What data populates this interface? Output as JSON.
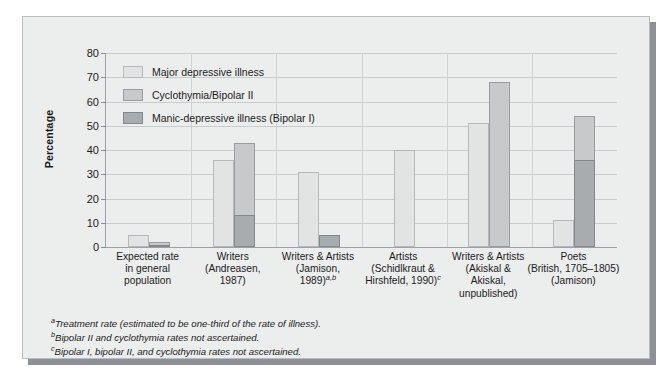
{
  "chart_data": {
    "type": "bar",
    "title": "",
    "subtitle": "",
    "xlabel": "",
    "ylabel": "Percentage",
    "ylim": [
      0,
      80
    ],
    "yticks": [
      0,
      10,
      20,
      30,
      40,
      50,
      60,
      70,
      80
    ],
    "grid": true,
    "legend_position": "inside-top-left",
    "categories": [
      "Expected rate\nin general\npopulation",
      "Writers\n(Andreasen,\n1987)",
      "Writers & Artists\n(Jamison,\n1989)",
      "Artists\n(Schidlkraut &\nHirshfeld, 1990)",
      "Writers & Artists\n(Akiskal &\nAkiskal,\nunpublished)",
      "Poets\n(British, 1705–1805)\n(Jamison)"
    ],
    "series": [
      {
        "name": "Major depressive illness",
        "color": "#e2e3e3",
        "values": [
          5,
          36,
          31,
          40,
          51,
          11
        ]
      },
      {
        "name": "Cyclothymia/Bipolar II",
        "color": "#c7c9ca",
        "values": [
          2,
          43,
          null,
          null,
          68,
          54
        ]
      },
      {
        "name": "Manic-depressive illness (Bipolar I)",
        "color": "#a9acae",
        "values": [
          1,
          13,
          5,
          null,
          null,
          36
        ]
      }
    ]
  },
  "axis": {
    "y_title": "Percentage",
    "y_ticks": [
      "0",
      "10",
      "20",
      "30",
      "40",
      "50",
      "60",
      "70",
      "80"
    ]
  },
  "legend": {
    "items": [
      {
        "label": "Major depressive illness"
      },
      {
        "label": "Cyclothymia/Bipolar II"
      },
      {
        "label": "Manic-depressive illness (Bipolar I)"
      }
    ]
  },
  "x_labels": [
    {
      "lines": [
        "Expected rate",
        "in general",
        "population"
      ],
      "marker": ""
    },
    {
      "lines": [
        "Writers",
        "(Andreasen,",
        "1987)"
      ],
      "marker": ""
    },
    {
      "lines": [
        "Writers & Artists",
        "(Jamison,",
        "1989)"
      ],
      "marker": "a,b"
    },
    {
      "lines": [
        "Artists",
        "(Schidlkraut &",
        "Hirshfeld, 1990)"
      ],
      "marker": "c"
    },
    {
      "lines": [
        "Writers & Artists",
        "(Akiskal &",
        "Akiskal,",
        "unpublished)"
      ],
      "marker": ""
    },
    {
      "lines": [
        "Poets",
        "(British, 1705–1805)",
        "(Jamison)"
      ],
      "marker": ""
    }
  ],
  "footnotes": [
    {
      "marker": "a",
      "text": "Treatment rate (estimated to be one-third of the rate of illness)."
    },
    {
      "marker": "b",
      "text": "Bipolar II and cyclothymia rates not ascertained."
    },
    {
      "marker": "c",
      "text": "Bipolar I, bipolar II, and cyclothymia rates not ascertained."
    }
  ],
  "colors": {
    "panel_background": "#eceded",
    "panel_border": "#b9bcbe",
    "shadow": "#8d9095",
    "gridline": "#c9cbcd",
    "axis": "#9ea1a4",
    "series_1": "#e2e3e3",
    "series_2": "#c7c9ca",
    "series_3": "#a9acae",
    "text": "#1b1b1b"
  }
}
